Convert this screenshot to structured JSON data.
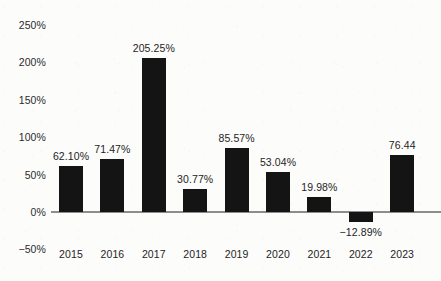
{
  "chart_data": {
    "type": "bar",
    "title": "",
    "subtitle": "",
    "xlabel": "",
    "ylabel": "",
    "categories": [
      "2015",
      "2016",
      "2017",
      "2018",
      "2019",
      "2020",
      "2021",
      "2022",
      "2023"
    ],
    "values": [
      62.1,
      71.47,
      205.25,
      30.77,
      85.57,
      53.04,
      19.98,
      -12.89,
      76.44
    ],
    "data_labels": [
      "62.10%",
      "71.47%",
      "205.25%",
      "30.77%",
      "85.57%",
      "53.04%",
      "19.98%",
      "−12.89%",
      "76.44"
    ],
    "ylim": [
      -50,
      250
    ],
    "y_ticks": [
      250,
      200,
      150,
      100,
      50,
      0,
      -50
    ],
    "y_tick_labels": [
      "250%",
      "200%",
      "150%",
      "100%",
      "50%",
      "0%",
      "−50%"
    ],
    "grid": false,
    "legend": null,
    "legend_position": "none",
    "bar_color": "#141414",
    "axis_color": "#8d8d8d",
    "text_color": "#242424",
    "background_color": "#fcfcfb"
  }
}
